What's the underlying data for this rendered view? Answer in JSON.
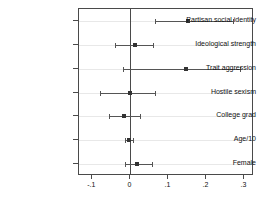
{
  "chart_data": {
    "type": "scatter",
    "subtype": "coefficient-plot",
    "title": "",
    "xlabel": "",
    "ylabel": "",
    "xlim": [
      -0.135,
      0.325
    ],
    "xticks": [
      -0.1,
      0,
      0.1,
      0.2,
      0.3
    ],
    "xticklabels": [
      "-.1",
      "0",
      ".1",
      ".2",
      ".3"
    ],
    "grid": true,
    "grid_orientation": "horizontal",
    "reference_line": 0,
    "legend": null,
    "categories": [
      "Partisan social identity",
      "Ideological strength",
      "Trait aggression",
      "Hostile sexism",
      "College grad",
      "Age/10",
      "Female"
    ],
    "estimates": [
      0.152,
      0.012,
      0.145,
      -0.001,
      -0.016,
      -0.003,
      0.018
    ],
    "ci_low": [
      0.066,
      -0.041,
      -0.019,
      -0.081,
      -0.056,
      -0.013,
      -0.015
    ],
    "ci_high": [
      0.27,
      0.059,
      0.289,
      0.066,
      0.026,
      0.008,
      0.056
    ],
    "points": [
      {
        "label": "Partisan social identity",
        "estimate": 0.152,
        "ci_low": 0.066,
        "ci_high": 0.27
      },
      {
        "label": "Ideological strength",
        "estimate": 0.012,
        "ci_low": -0.041,
        "ci_high": 0.059
      },
      {
        "label": "Trait aggression",
        "estimate": 0.145,
        "ci_low": -0.019,
        "ci_high": 0.289
      },
      {
        "label": "Hostile sexism",
        "estimate": -0.001,
        "ci_low": -0.081,
        "ci_high": 0.066
      },
      {
        "label": "College grad",
        "estimate": -0.016,
        "ci_low": -0.056,
        "ci_high": 0.026
      },
      {
        "label": "Age/10",
        "estimate": -0.003,
        "ci_low": -0.013,
        "ci_high": 0.008
      },
      {
        "label": "Female",
        "estimate": 0.018,
        "ci_low": -0.015,
        "ci_high": 0.056
      }
    ],
    "colors": {
      "marker": "#333333",
      "interval": "#555555",
      "axis": "#4a4a4a",
      "grid": "#e8e8e8",
      "background": "#ffffff"
    }
  }
}
